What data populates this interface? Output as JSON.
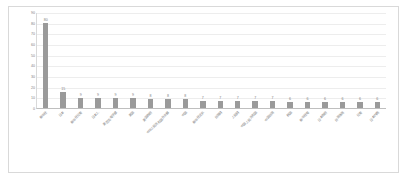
{
  "chart_data": {
    "type": "bar",
    "title": "",
    "xlabel": "",
    "ylabel": "",
    "ylim": [
      0,
      90
    ],
    "yticks": [
      0,
      10,
      20,
      30,
      40,
      50,
      60,
      70,
      80,
      90
    ],
    "grid": true,
    "legend": "none",
    "orientation": "vertical",
    "bar_color": "#9a9a9a",
    "categories": [
      "新华社",
      "日本",
      "新华社记者",
      "日本人",
      "美丽岛电子报",
      "美国",
      "美国政府",
      "中华人民共和国外交部",
      "中国",
      "新华社北京",
      "台湾网",
      "人民网",
      "中国人民共和国",
      "中国台湾",
      "韩国",
      "新华社电",
      "日本政府",
      "台湾当局",
      "记者",
      "日本内阁"
    ],
    "values": [
      80,
      15,
      9,
      9,
      9,
      9,
      8,
      8,
      8,
      7,
      7,
      7,
      7,
      7,
      6,
      6,
      6,
      6,
      6,
      6
    ],
    "data_labels": [
      "80",
      "15",
      "9",
      "9",
      "9",
      "9",
      "8",
      "8",
      "8",
      "7",
      "7",
      "7",
      "7",
      "7",
      "6",
      "6",
      "6",
      "6",
      "6",
      "6"
    ]
  },
  "colors": {
    "bar": "#9a9a9a",
    "gridline": "#ededed",
    "axis": "#bfbfbf",
    "tick_text": "#808080",
    "frame_border": "#d9d9d9",
    "background": "#ffffff"
  }
}
